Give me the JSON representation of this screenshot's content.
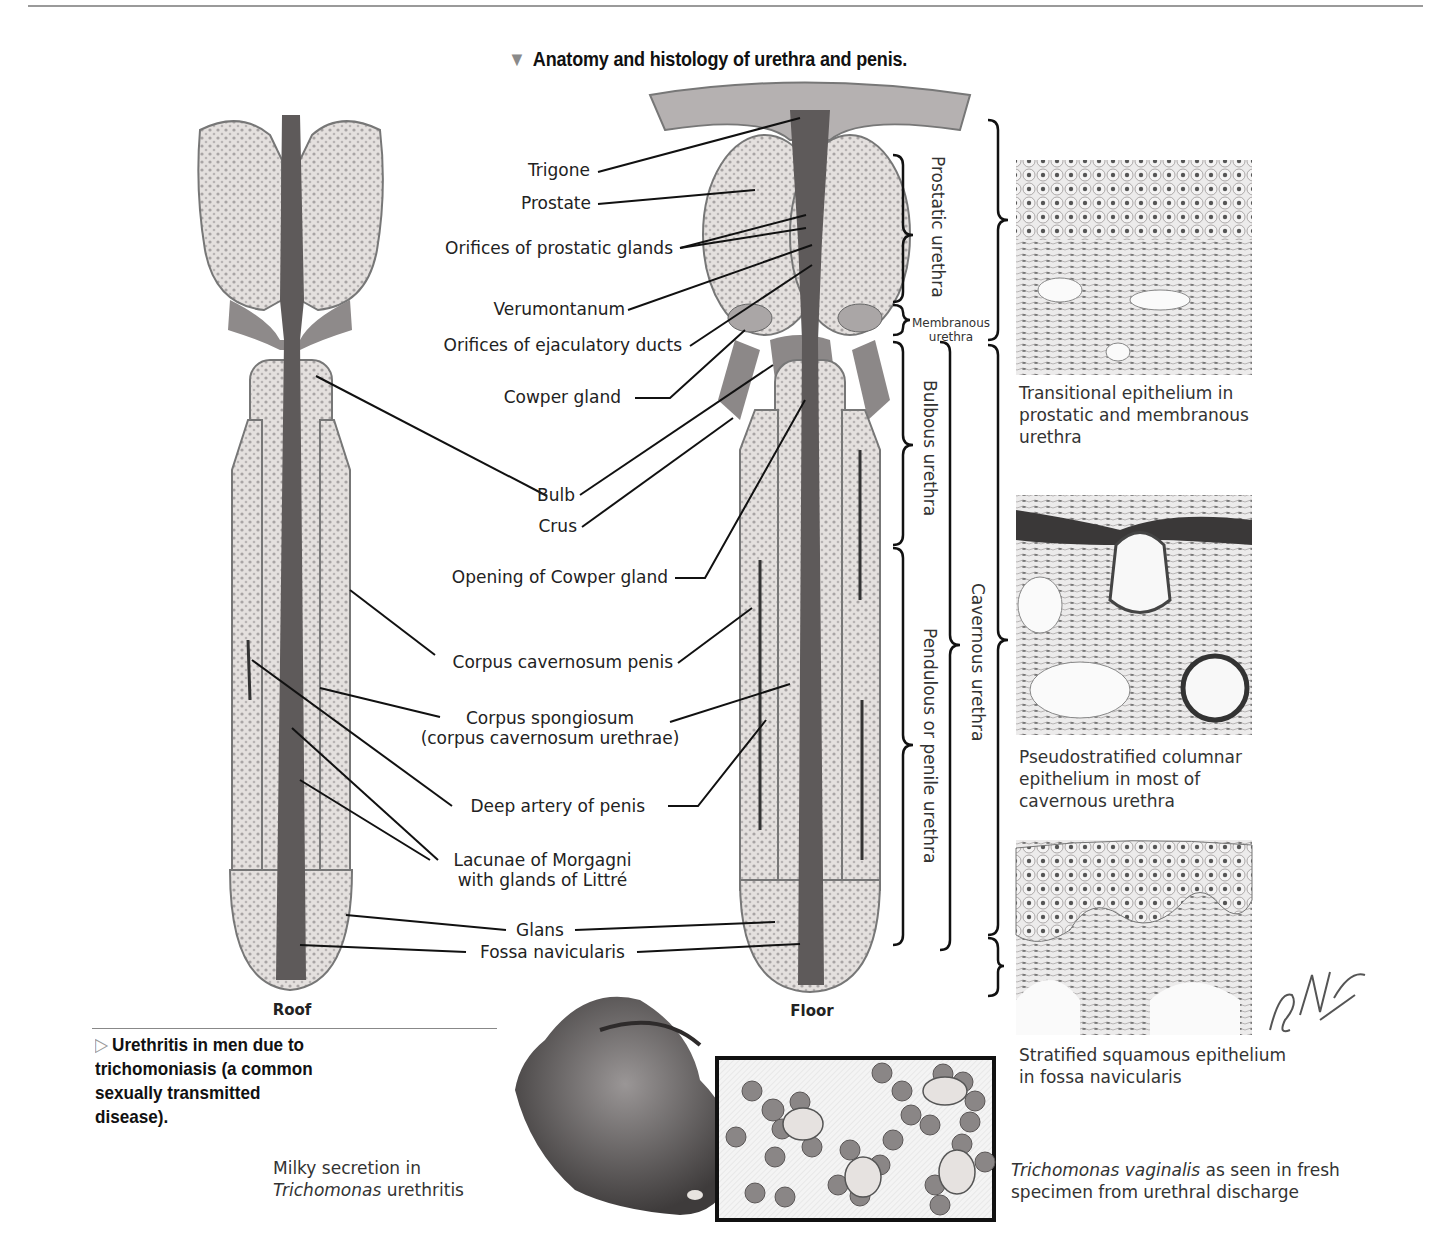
{
  "title": {
    "marker": "▼",
    "text": "Anatomy and histology of urethra and penis."
  },
  "views": {
    "left": "Roof",
    "right": "Floor"
  },
  "labels": {
    "trigone": "Trigone",
    "prostate": "Prostate",
    "orifices_prostatic": "Orifices of prostatic glands",
    "verumontanum": "Verumontanum",
    "orifices_ejaculatory": "Orifices of ejaculatory ducts",
    "cowper_gland": "Cowper gland",
    "bulb": "Bulb",
    "crus": "Crus",
    "opening_cowper": "Opening of Cowper gland",
    "corpus_cavernosum": "Corpus cavernosum penis",
    "corpus_spongiosum_1": "Corpus spongiosum",
    "corpus_spongiosum_2": "(corpus cavernosum urethrae)",
    "deep_artery": "Deep artery of penis",
    "lacunae_1": "Lacunae of Morgagni",
    "lacunae_2": "with glands of Littré",
    "glans": "Glans",
    "fossa": "Fossa navicularis"
  },
  "regions": {
    "prostatic": "Prostatic urethra",
    "membranous_1": "Membranous",
    "membranous_2": "urethra",
    "bulbous": "Bulbous urethra",
    "pendulous": "Pendulous or penile urethra",
    "cavernous": "Cavernous urethra"
  },
  "histology": [
    {
      "line1": "Transitional epithelium in",
      "line2": "prostatic and membranous",
      "line3": "urethra"
    },
    {
      "line1": "Pseudostratified columnar",
      "line2": "epithelium in most of",
      "line3": "cavernous urethra"
    },
    {
      "line1": "Stratified squamous epithelium",
      "line2": "in fossa navicularis"
    }
  ],
  "subsection": {
    "marker": "▷",
    "text": "Urethritis in men due to trichomoniasis (a common sexually transmitted disease)."
  },
  "captions": {
    "milky_italic_prefix": "",
    "milky_line1": "Milky secretion in",
    "milky_italic": "Trichomonas",
    "milky_rest": " urethritis",
    "tricho_italic": "Trichomonas vaginalis",
    "tricho_rest1": " as seen in fresh",
    "tricho_line2": "specimen from urethral discharge"
  },
  "signature": "F. Netter M.D.",
  "colors": {
    "line": "#111111",
    "tissue": "#d8d4d2",
    "tissue_dark": "#6e6a6a",
    "lumen": "#5a5656"
  }
}
